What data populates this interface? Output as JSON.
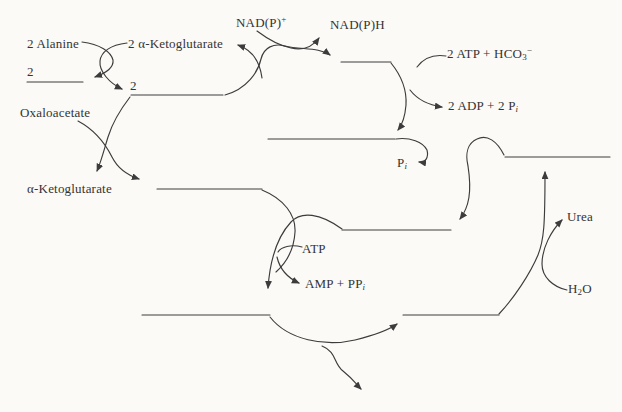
{
  "diagram": {
    "type": "metabolic-pathway-fill-in-the-blanks",
    "blanks_count": 9,
    "colors": {
      "ink": "#3c3c3c",
      "paper": "#fbfaf7"
    },
    "labels": {
      "alanine": {
        "text": "2 Alanine"
      },
      "akg_in": {
        "text": "2 α-Ketoglutarate"
      },
      "nadp": {
        "base": "NAD(P)",
        "sup": "+"
      },
      "nadph": {
        "text": "NAD(P)H"
      },
      "atp_hco3": {
        "base": "2 ATP + HCO",
        "sub": "3",
        "sup": "−"
      },
      "adp_pi": {
        "base": "2 ADP + 2 P",
        "sub_i": "i"
      },
      "oxaloacetate": {
        "text": "Oxaloacetate"
      },
      "akg_out": {
        "text": "α-Ketoglutarate"
      },
      "pi": {
        "base": "P",
        "sub_i": "i"
      },
      "atp": {
        "text": "ATP"
      },
      "amp_ppi": {
        "base": "AMP + PP",
        "sub_i": "i"
      },
      "urea": {
        "text": "Urea"
      },
      "h2o": {
        "base": "H",
        "sub": "2",
        "post": "O"
      },
      "coeff_blank1": {
        "text": "2"
      },
      "coeff_blank2": {
        "text": "2"
      }
    }
  }
}
